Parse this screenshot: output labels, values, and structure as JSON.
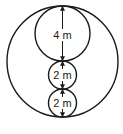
{
  "diagram": {
    "type": "nested-circles-dimension",
    "colors": {
      "stroke": "#1a1a1a",
      "background": "#ffffff"
    },
    "outer_circle": {
      "cx": 62.5,
      "cy": 61.5,
      "r": 55.5
    },
    "circles": [
      {
        "id": "large",
        "cx": 62.5,
        "cy": 33.5,
        "r": 27.5,
        "label": "4 m",
        "label_y": 39
      },
      {
        "id": "small-1",
        "cx": 62.5,
        "cy": 75,
        "r": 14,
        "label": "2 m",
        "label_y": 79
      },
      {
        "id": "small-2",
        "cx": 62.5,
        "cy": 103,
        "r": 14,
        "label": "2 m",
        "label_y": 107
      }
    ]
  }
}
